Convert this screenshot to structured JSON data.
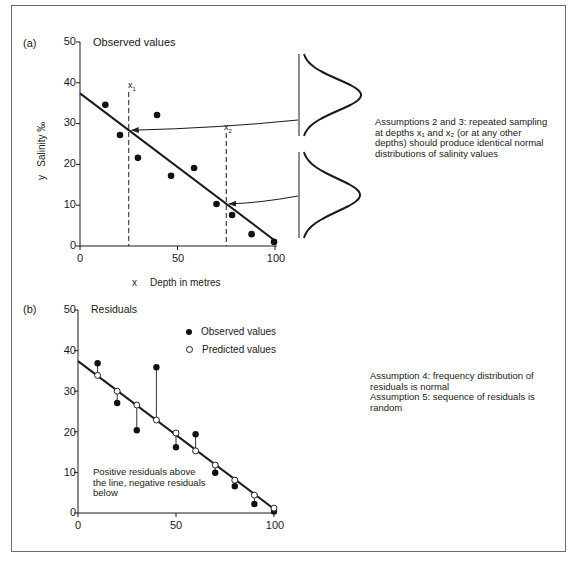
{
  "panel_a": {
    "tag": "(a)",
    "title": "Observed values",
    "y_label_var": "y",
    "y_label": "Salinity ‰",
    "x_label_var": "x",
    "x_label": "Depth in metres",
    "y_ticks": [
      "50",
      "40",
      "30",
      "20",
      "10",
      "0"
    ],
    "x_ticks": [
      "0",
      "50",
      "100"
    ],
    "x1_label": "x",
    "x1_sub": "1",
    "x2_label": "x",
    "x2_sub": "2",
    "note_lines": [
      "Assumptions 2 and 3: repeated sampling",
      "at depths x₁ and x₂ (or at any other",
      "depths) should produce identical normal",
      "distributions of salinity values"
    ]
  },
  "panel_b": {
    "tag": "(b)",
    "title": "Residuals",
    "y_ticks": [
      "50",
      "40",
      "30",
      "20",
      "10",
      "0"
    ],
    "x_ticks": [
      "0",
      "50",
      "100"
    ],
    "legend": {
      "observed": "Observed values",
      "predicted": "Predicted values"
    },
    "inner_note_lines": [
      "Positive residuals above",
      "the line, negative residuals",
      "below"
    ],
    "note_lines": [
      "Assumption 4: frequency distribution of",
      "residuals is normal",
      "Assumption 5: sequence of residuals is",
      "random"
    ]
  },
  "chart_data": [
    {
      "type": "scatter",
      "title": "(a) Observed values",
      "xlabel": "x   Depth in metres",
      "ylabel": "y   Salinity ‰",
      "xlim": [
        0,
        100
      ],
      "ylim": [
        0,
        50
      ],
      "x_ticks": [
        0,
        50,
        100
      ],
      "y_ticks": [
        0,
        10,
        20,
        30,
        40,
        50
      ],
      "grid": false,
      "series": [
        {
          "name": "Observed values",
          "x": [
            13,
            20.5,
            29.7,
            39.5,
            46.7,
            58.5,
            70,
            78,
            88,
            99.5
          ],
          "y": [
            34.6,
            27.2,
            21.6,
            32.1,
            17.2,
            19.1,
            10.3,
            7.6,
            2.9,
            1.0
          ]
        },
        {
          "name": "Regression line",
          "x": [
            0,
            100
          ],
          "y": [
            37.4,
            1.3
          ]
        }
      ],
      "annotations": [
        {
          "type": "vline",
          "x": 25,
          "label": "x1",
          "style": "dashed"
        },
        {
          "type": "vline",
          "x": 75,
          "label": "x2",
          "style": "dashed"
        },
        {
          "type": "normal-curve",
          "at": "x1",
          "note": "arrow from distribution to line at x1"
        },
        {
          "type": "normal-curve",
          "at": "x2",
          "note": "arrow from distribution to line at x2"
        },
        {
          "type": "text",
          "text": "Assumptions 2 and 3: repeated sampling at depths x1 and x2 (or at any other depths) should produce identical normal distributions of salinity values"
        }
      ]
    },
    {
      "type": "scatter",
      "title": "(b) Residuals",
      "xlim": [
        0,
        100
      ],
      "ylim": [
        0,
        50
      ],
      "x_ticks": [
        0,
        50,
        100
      ],
      "y_ticks": [
        0,
        10,
        20,
        30,
        40,
        50
      ],
      "grid": false,
      "legend_position": "upper right",
      "series": [
        {
          "name": "Observed values",
          "x": [
            10,
            20,
            30,
            40,
            50,
            60,
            70,
            80,
            90,
            100
          ],
          "y": [
            36.9,
            27.1,
            20.4,
            35.9,
            16.2,
            19.4,
            9.9,
            6.6,
            2.2,
            0.4
          ]
        },
        {
          "name": "Predicted values",
          "x": [
            10,
            20,
            30,
            40,
            50,
            60,
            70,
            80,
            90,
            100
          ],
          "y": [
            33.9,
            30.0,
            26.6,
            22.9,
            19.7,
            15.3,
            11.8,
            8.1,
            4.4,
            1.2
          ]
        },
        {
          "name": "Regression line",
          "x": [
            0,
            100
          ],
          "y": [
            37.4,
            1.0
          ]
        }
      ],
      "annotations": [
        {
          "type": "text",
          "text": "Positive residuals above the line, negative residuals below"
        },
        {
          "type": "text",
          "text": "Assumption 4: frequency distribution of residuals is normal"
        },
        {
          "type": "text",
          "text": "Assumption 5: sequence of residuals is random"
        }
      ]
    }
  ]
}
